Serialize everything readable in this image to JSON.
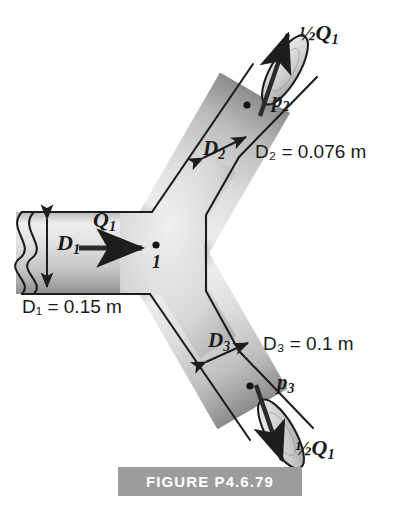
{
  "figure": {
    "caption": "FIGURE P4.6.79",
    "caption_bg": "#9c9c9c",
    "caption_color": "#ffffff",
    "pipe_fill_light": "#e9e9e9",
    "pipe_fill_mid": "#d2d2d2",
    "pipe_fill_dark": "#9b9b9b",
    "outline_color": "#1d1d1d"
  },
  "labels": {
    "inlet_diameter_symbol": "D",
    "inlet_diameter_sub": "1",
    "inlet_flow_symbol": "Q",
    "inlet_flow_sub": "1",
    "junction_point": "1",
    "inlet_diameter_value": "D₁ = 0.15 m",
    "branch2_diameter_symbol": "D",
    "branch2_diameter_sub": "2",
    "branch2_diameter_value": "D₂ = 0.076 m",
    "branch2_pressure": "p",
    "branch2_pressure_sub": "2",
    "branch2_flow": "½Q",
    "branch2_flow_sub": "1",
    "branch3_diameter_symbol": "D",
    "branch3_diameter_sub": "3",
    "branch3_diameter_value": "D₃ = 0.1 m",
    "branch3_pressure": "p",
    "branch3_pressure_sub": "3",
    "branch3_flow": "½Q",
    "branch3_flow_sub": "1"
  },
  "values": {
    "D1": "0.15 m",
    "D2": "0.076 m",
    "D3": "0.1 m",
    "Q2": "½Q₁",
    "Q3": "½Q₁"
  }
}
